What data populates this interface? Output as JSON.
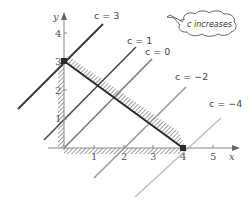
{
  "diagram": {
    "axes": {
      "x_label": "x",
      "y_label": "y",
      "x_ticks": [
        "1",
        "2",
        "3",
        "4",
        "5"
      ],
      "y_ticks": [
        "1",
        "2",
        "3",
        "4"
      ]
    },
    "level_lines": [
      {
        "label": "c = 3",
        "c": 3,
        "color": "#3a3a3a"
      },
      {
        "label": "c = 1",
        "c": 1,
        "color": "#4a4a4a"
      },
      {
        "label": "c = 0",
        "c": 0,
        "color": "#7a7a7a"
      },
      {
        "label": "c = −2",
        "c": -2,
        "color": "#9a9a9a"
      },
      {
        "label": "c = −4",
        "c": -4,
        "color": "#c2c2c2"
      }
    ],
    "constraint": {
      "from": [
        0,
        3
      ],
      "to": [
        4,
        0
      ],
      "color": "#2a2a2a"
    },
    "callout": {
      "text": "c increases"
    }
  }
}
